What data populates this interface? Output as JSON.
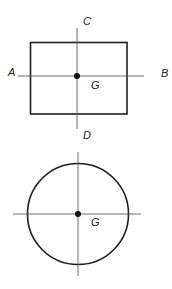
{
  "diagram": {
    "colors": {
      "outline": "#1e1e1e",
      "axis": "#5a5a5a",
      "centroid": "#111111",
      "background": "#ffffff"
    },
    "rectangle_figure": {
      "shape": "rectangle",
      "labels": {
        "top_axis": "C",
        "left_axis": "A",
        "right_axis": "B",
        "bottom_axis": "D",
        "centroid": "G"
      }
    },
    "circle_figure": {
      "shape": "circle",
      "labels": {
        "centroid": "G"
      }
    }
  }
}
